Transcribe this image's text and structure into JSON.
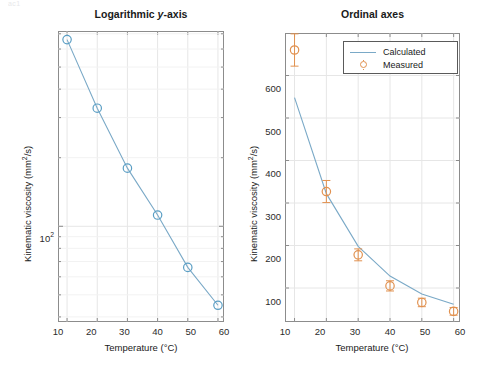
{
  "figure": {
    "width": 480,
    "height": 376,
    "background": "#ffffff",
    "faint_top_fragment": "ac1",
    "colors": {
      "calculated_line": "#7aa9c7",
      "calculated_marker": "#5a9ec4",
      "measured_marker": "#e1914f",
      "measured_errorbar": "#e1914f",
      "axis": "#8c8c8c",
      "grid": "#e6e6e6",
      "text": "#1a1a1a"
    }
  },
  "panels": [
    {
      "id": "left",
      "title": "Logarithmic y-axis",
      "title_italic_part": "y",
      "xlabel": "Temperature (°C)",
      "ylabel": "Kinematic viscosity (mm²/s)",
      "yscale": "log",
      "xscale": "linear",
      "xticks": [
        "10",
        "20",
        "30",
        "40",
        "50",
        "60"
      ],
      "yticks": [
        "10²"
      ],
      "legend": null
    },
    {
      "id": "right",
      "title": "Ordinal axes",
      "xlabel": "Temperature (°C)",
      "ylabel": "Kinematic viscosity (mm²/s)",
      "yscale": "linear",
      "xscale": "linear",
      "xticks": [
        "10",
        "20",
        "30",
        "40",
        "50",
        "60"
      ],
      "yticks": [
        "100",
        "200",
        "300",
        "400",
        "500",
        "600"
      ],
      "legend": {
        "entries": [
          {
            "label": "Calculated",
            "kind": "line"
          },
          {
            "label": "Measured",
            "kind": "marker"
          }
        ]
      }
    }
  ],
  "chart_data": [
    {
      "type": "line",
      "id": "logarithmic-y-axis",
      "title": "Logarithmic y-axis",
      "xlabel": "Temperature (°C)",
      "ylabel": "Kinematic viscosity (mm²/s)",
      "xscale": "linear",
      "yscale": "log",
      "xlim": [
        7,
        62
      ],
      "ylim": [
        38,
        720
      ],
      "xticks": [
        10,
        20,
        30,
        40,
        50,
        60
      ],
      "yticks": [
        100
      ],
      "ytick_labels": [
        "10²"
      ],
      "grid": true,
      "legend": "none",
      "x": [
        10,
        20,
        30,
        40,
        50,
        60
      ],
      "series": [
        {
          "name": "Calculated",
          "style": "line-with-circle-markers",
          "color": "#5a9ec4",
          "values": [
            660,
            330,
            180,
            112,
            66,
            45
          ]
        }
      ]
    },
    {
      "type": "line",
      "id": "ordinal-axes",
      "title": "Ordinal axes",
      "xlabel": "Temperature (°C)",
      "ylabel": "Kinematic viscosity (mm²/s)",
      "xscale": "linear",
      "yscale": "linear",
      "xlim": [
        7,
        62
      ],
      "ylim": [
        20,
        700
      ],
      "xticks": [
        10,
        20,
        30,
        40,
        50,
        60
      ],
      "yticks": [
        100,
        200,
        300,
        400,
        500,
        600
      ],
      "grid": true,
      "legend": "top-right",
      "x": [
        10,
        20,
        30,
        40,
        50,
        60
      ],
      "series": [
        {
          "name": "Calculated",
          "style": "line",
          "color": "#7aa9c7",
          "values": [
            548,
            322,
            198,
            128,
            86,
            62
          ]
        },
        {
          "name": "Measured",
          "style": "circle-markers-with-errorbars",
          "color": "#e1914f",
          "values": [
            660,
            327,
            178,
            105,
            66,
            45
          ],
          "errors": [
            38,
            26,
            14,
            12,
            10,
            9
          ]
        }
      ]
    }
  ]
}
